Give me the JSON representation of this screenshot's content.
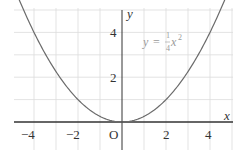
{
  "chart_data": {
    "type": "line",
    "title": "",
    "xlabel": "x",
    "ylabel": "y",
    "xlim": [
      -4.7,
      4.8
    ],
    "ylim": [
      -1.2,
      5.2
    ],
    "grid": true,
    "x_ticks": [
      -4,
      -2,
      2,
      4
    ],
    "x_tick_labels": [
      "−4",
      "−2",
      "2",
      "4"
    ],
    "y_ticks": [
      2,
      4
    ],
    "y_tick_labels": [
      "2",
      "4"
    ],
    "origin_label": "O",
    "series": [
      {
        "name": "y = 1/4 x^2",
        "function": "0.25*x^2",
        "x": [
          -4.5,
          -4,
          -3,
          -2,
          -1,
          0,
          1,
          2,
          3,
          4,
          4.5
        ],
        "values": [
          5.06,
          4,
          2.25,
          1,
          0.25,
          0,
          0.25,
          1,
          2.25,
          4,
          5.06
        ],
        "color": "#6b6b6b"
      }
    ],
    "annotations": [
      {
        "text": "y = (1/4)x²",
        "x": 2.1,
        "y": 3.7
      }
    ]
  },
  "labels": {
    "x_axis": "x",
    "y_axis": "y",
    "origin": "O",
    "eq_lhs": "y",
    "eq_equals": "=",
    "eq_num": "1",
    "eq_den": "4",
    "eq_var": "x",
    "eq_exp": "2",
    "tick_x_m4": "−4",
    "tick_x_m2": "−2",
    "tick_x_2": "2",
    "tick_x_4": "4",
    "tick_y_2": "2",
    "tick_y_4": "4"
  },
  "colors": {
    "grid": "#dcdcdc",
    "axis": "#333333",
    "curve": "#6b6b6b",
    "equation": "#9a9a9a"
  }
}
